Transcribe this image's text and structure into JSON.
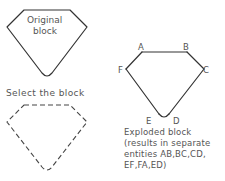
{
  "original": {
    "label_line1": "Original",
    "label_line2": "block"
  },
  "selected": {
    "caption": "Select the block"
  },
  "exploded": {
    "vertices": {
      "A": "A",
      "B": "B",
      "C": "C",
      "D": "D",
      "E": "E",
      "F": "F"
    },
    "caption_lines": [
      "Exploded block",
      "(results in separate",
      "entities AB,BC,CD,",
      "EF,FA,ED)"
    ]
  },
  "colors": {
    "stroke": "#333333",
    "text": "#555555"
  }
}
